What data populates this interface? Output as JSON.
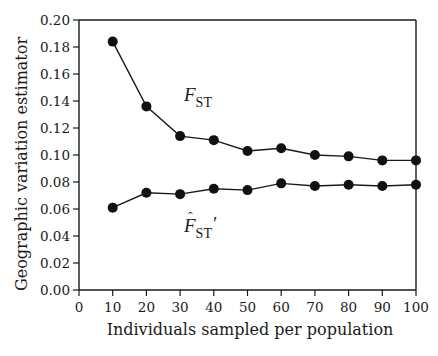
{
  "chart_data": {
    "type": "line",
    "title": "",
    "xlabel": "Individuals sampled per population",
    "ylabel": "Geographic variation estimator",
    "xlim": [
      0,
      100
    ],
    "ylim": [
      0.0,
      0.2
    ],
    "xticks": [
      0,
      10,
      20,
      30,
      40,
      50,
      60,
      70,
      80,
      90,
      100
    ],
    "yticks": [
      0.0,
      0.02,
      0.04,
      0.06,
      0.08,
      0.1,
      0.12,
      0.14,
      0.16,
      0.18,
      0.2
    ],
    "xtick_labels": [
      "0",
      "10",
      "20",
      "30",
      "40",
      "50",
      "60",
      "70",
      "80",
      "90",
      "100"
    ],
    "ytick_labels": [
      "0.00",
      "0.02",
      "0.04",
      "0.06",
      "0.08",
      "0.10",
      "0.12",
      "0.14",
      "0.16",
      "0.18",
      "0.20"
    ],
    "grid": false,
    "legend": "inline labels",
    "x": [
      10,
      20,
      30,
      40,
      50,
      60,
      70,
      80,
      90,
      100
    ],
    "series": [
      {
        "name": "F_ST",
        "label_main": "F",
        "label_sub": "ST",
        "label_suffix": "",
        "label_hat": false,
        "values": [
          0.184,
          0.136,
          0.114,
          0.111,
          0.103,
          0.105,
          0.1,
          0.099,
          0.096,
          0.096
        ]
      },
      {
        "name": "F̂_ST′",
        "label_main": "F",
        "label_sub": "ST",
        "label_suffix": "′",
        "label_hat": true,
        "values": [
          0.061,
          0.072,
          0.071,
          0.075,
          0.074,
          0.079,
          0.077,
          0.078,
          0.077,
          0.078
        ]
      }
    ]
  }
}
